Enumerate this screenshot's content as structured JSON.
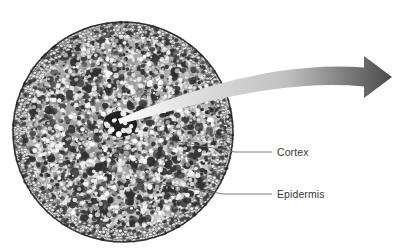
{
  "figure": {
    "width": 404,
    "height": 250,
    "background_color": "#ffffff"
  },
  "specimen": {
    "name": "stem-cross-section",
    "shape": "circle",
    "center_x": 123,
    "center_y": 132,
    "radius_x": 110,
    "radius_y": 110,
    "outline_color": "#1a1a1a",
    "cell_dark_color": "#2e2e2e",
    "cell_mid_color": "#8c8c8c",
    "cell_light_color": "#f2f2f2",
    "epidermis_ring_color": "#3a3a3a",
    "stele": {
      "name": "vascular-bundle",
      "center_x": 120,
      "center_y": 124,
      "radius_x": 17,
      "radius_y": 13,
      "color": "#111111"
    }
  },
  "arrow": {
    "name": "magnification-arrow",
    "tail_x": 118,
    "tail_y": 119,
    "tip_x": 392,
    "tip_y": 77,
    "gradient_start_color": "#ffffff",
    "gradient_mid_color": "#bfbfbf",
    "gradient_end_color": "#4a4a4a"
  },
  "callouts": [
    {
      "id": "cortex",
      "label": "Cortex",
      "leader_start_x": 168,
      "leader_start_y": 140,
      "leader_elbow_x": 235,
      "leader_elbow_y": 152,
      "leader_end_x": 272,
      "leader_end_y": 152,
      "label_x": 277,
      "label_y": 147,
      "line_color": "#6b6b6d",
      "text_color": "#38383a"
    },
    {
      "id": "epidermis",
      "label": "Epidermis",
      "leader_start_x": 143,
      "leader_start_y": 181,
      "leader_elbow_x": 224,
      "leader_elbow_y": 194,
      "leader_end_x": 272,
      "leader_end_y": 194,
      "label_x": 277,
      "label_y": 189,
      "line_color": "#6b6b6d",
      "text_color": "#38383a"
    }
  ]
}
